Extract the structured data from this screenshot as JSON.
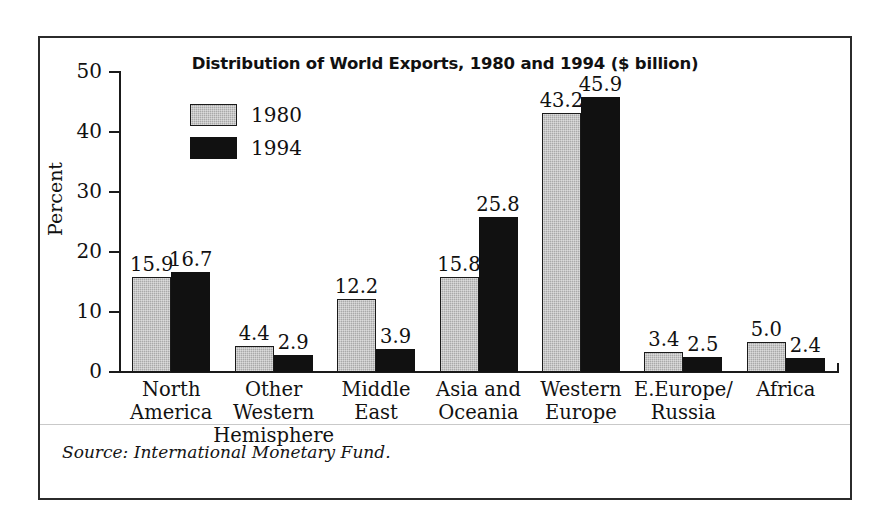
{
  "figure": {
    "source_note": "Source: International Monetary Fund."
  },
  "chart_data": {
    "type": "bar",
    "title": "Distribution of World Exports, 1980 and 1994 ($ billion)",
    "xlabel": "",
    "ylabel": "Percent",
    "ylim": [
      0,
      50
    ],
    "yticks": [
      0,
      10,
      20,
      30,
      40,
      50
    ],
    "ytick_labels": [
      "0",
      "10",
      "20",
      "30",
      "40",
      "50"
    ],
    "grid": false,
    "legend_position": "upper-left-inside",
    "categories": [
      "North\nAmerica",
      "Other\nWestern\nHemisphere",
      "Middle\nEast",
      "Asia and\nOceania",
      "Western\nEurope",
      "E.Europe/\nRussia",
      "Africa"
    ],
    "series": [
      {
        "name": "1980",
        "color": "#a9a9a9",
        "values": [
          15.9,
          4.4,
          12.2,
          15.8,
          43.2,
          3.4,
          5.0
        ],
        "labels": [
          "15.9",
          "4.4",
          "12.2",
          "15.8",
          "43.2",
          "3.4",
          "5.0"
        ]
      },
      {
        "name": "1994",
        "color": "#111111",
        "values": [
          16.7,
          2.9,
          3.9,
          25.8,
          45.9,
          2.5,
          2.4
        ],
        "labels": [
          "16.7",
          "2.9",
          "3.9",
          "25.8",
          "45.9",
          "2.5",
          "2.4"
        ]
      }
    ]
  }
}
